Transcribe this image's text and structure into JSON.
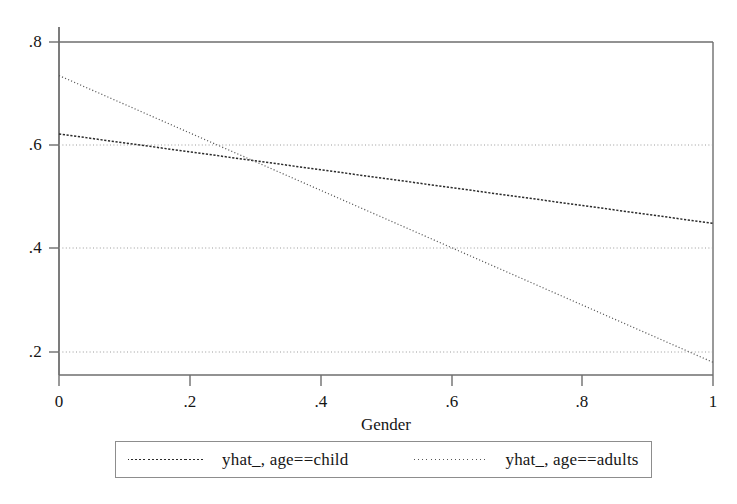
{
  "chart_data": {
    "type": "line",
    "title": "",
    "xlabel": "Gender",
    "ylabel": "",
    "xlim": [
      0,
      1
    ],
    "ylim": [
      0.2,
      0.8
    ],
    "grid": true,
    "grid_axis": "y",
    "legend_position": "bottom",
    "x_ticks": [
      "0",
      ".2",
      ".4",
      ".6",
      ".8",
      "1"
    ],
    "x_tick_values": [
      0,
      0.2,
      0.4,
      0.6,
      0.8,
      1
    ],
    "y_ticks": [
      ".2",
      ".4",
      ".6",
      ".8"
    ],
    "y_tick_values": [
      0.2,
      0.4,
      0.6,
      0.8
    ],
    "x": [
      0,
      1
    ],
    "series": [
      {
        "name": "yhat_, age==child",
        "values": [
          0.622,
          0.449
        ],
        "style": "dashed",
        "color": "#2b2b2b"
      },
      {
        "name": "yhat_, age==adults",
        "values": [
          0.735,
          0.18
        ],
        "style": "dotted",
        "color": "#555555"
      }
    ],
    "annotations": {
      "intersection_x": 0.297,
      "intersection_y": 0.572
    }
  },
  "axes": {
    "x_axis_title": "Gender",
    "x_tick_labels": [
      "0",
      ".2",
      ".4",
      ".6",
      ".8",
      "1"
    ],
    "y_tick_labels": [
      ".8",
      ".6",
      ".4",
      ".2"
    ]
  },
  "legend": {
    "entries": [
      {
        "label": "yhat_, age==child"
      },
      {
        "label": "yhat_, age==adults"
      }
    ]
  },
  "colors": {
    "background": "#ffffff",
    "frame": "#6e6e6e",
    "gridline": "#9a9a9a",
    "series_child": "#2b2b2b",
    "series_adults": "#555555",
    "text": "#151515"
  }
}
